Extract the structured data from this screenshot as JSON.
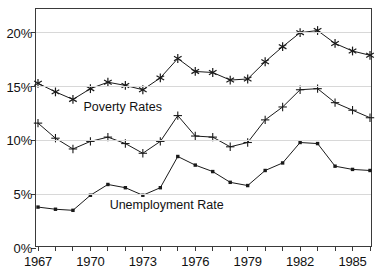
{
  "chart_data": {
    "type": "line",
    "title": "",
    "xlabel": "",
    "ylabel": "",
    "x": [
      1967,
      1968,
      1969,
      1970,
      1971,
      1972,
      1973,
      1974,
      1975,
      1976,
      1977,
      1978,
      1979,
      1980,
      1981,
      1982,
      1983,
      1984,
      1985,
      1986
    ],
    "xlim": [
      1967,
      1986
    ],
    "ylim": [
      0,
      22.2
    ],
    "yticks": [
      0,
      5,
      10,
      15,
      20
    ],
    "ytick_labels": [
      "0%",
      "5%",
      "10%",
      "15%",
      "20%"
    ],
    "xticks": [
      1967,
      1968,
      1969,
      1970,
      1971,
      1972,
      1973,
      1974,
      1975,
      1976,
      1977,
      1978,
      1979,
      1980,
      1981,
      1982,
      1983,
      1984,
      1985,
      1986
    ],
    "xtick_labels": [
      "1967",
      "1970",
      "1973",
      "1976",
      "1979",
      "1982",
      "1985"
    ],
    "xtick_labeled_years": [
      1967,
      1970,
      1973,
      1976,
      1979,
      1982,
      1985
    ],
    "grid": true,
    "grid_axis": "y",
    "legend_position": "inline-annotation",
    "series": [
      {
        "name": "Poverty Rates",
        "marker": "asterisk",
        "color": "#1a1a1a",
        "values": [
          15.3,
          14.5,
          13.8,
          14.8,
          15.4,
          15.1,
          14.7,
          15.8,
          17.6,
          16.4,
          16.3,
          15.6,
          15.7,
          17.3,
          18.7,
          20.0,
          20.2,
          19.0,
          18.3,
          17.9
        ]
      },
      {
        "name": "Poverty Rates (secondary)",
        "marker": "plus",
        "color": "#1a1a1a",
        "values": [
          11.6,
          10.2,
          9.2,
          9.9,
          10.3,
          9.7,
          8.8,
          9.9,
          12.3,
          10.4,
          10.3,
          9.4,
          9.8,
          11.9,
          13.1,
          14.7,
          14.8,
          13.5,
          12.8,
          12.1
        ]
      },
      {
        "name": "Unemployment Rate",
        "marker": "dot",
        "color": "#1a1a1a",
        "values": [
          3.8,
          3.6,
          3.5,
          4.9,
          5.9,
          5.6,
          4.9,
          5.6,
          8.5,
          7.7,
          7.1,
          6.1,
          5.8,
          7.2,
          7.9,
          9.8,
          9.7,
          7.6,
          7.3,
          7.2
        ]
      }
    ],
    "annotations": [
      {
        "id": "poverty-rates-label",
        "text": "Poverty Rates",
        "x": 1969.6,
        "y": 13.0
      },
      {
        "id": "unemployment-rate-label",
        "text": "Unemployment Rate",
        "x": 1971.1,
        "y": 3.9
      }
    ]
  }
}
